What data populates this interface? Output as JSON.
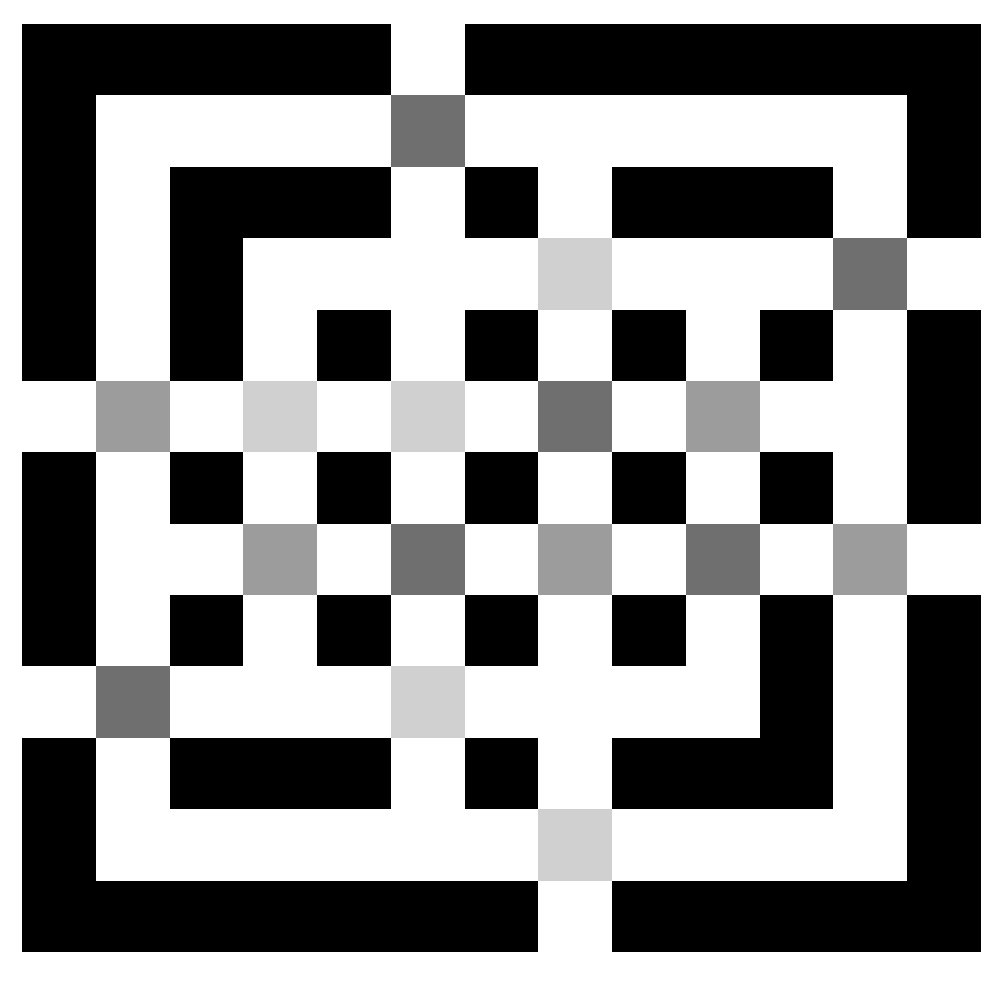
{
  "puzzle": {
    "rows": 13,
    "cols": 13,
    "palette": {
      "B": "#000000",
      "W": "#ffffff",
      "D": "#6f6f6f",
      "M": "#9c9c9c",
      "L": "#d0d0d0"
    },
    "legend": {
      "B": "wall",
      "W": "path",
      "D": "dark-grey-tile",
      "M": "medium-grey-tile",
      "L": "light-grey-tile"
    },
    "grid": [
      "BBBBBWBBBBBBB",
      "BWWWWDWWWWWWB",
      "BWBBBWBWBBBWB",
      "BWBWWWWLWWWDW",
      "BWBWBWBWBWBWB",
      "WMWLWLWDWMWWB",
      "BWBWBWBWBWBWB",
      "BWWMWDWMWDWMW",
      "BWBWBWBWBWBWB",
      "WDWWWLWWWWBWB",
      "BWBBBWBWBBBWB",
      "BWWWWWWLWWWWB",
      "BBBBBBBWBBBBB"
    ]
  }
}
